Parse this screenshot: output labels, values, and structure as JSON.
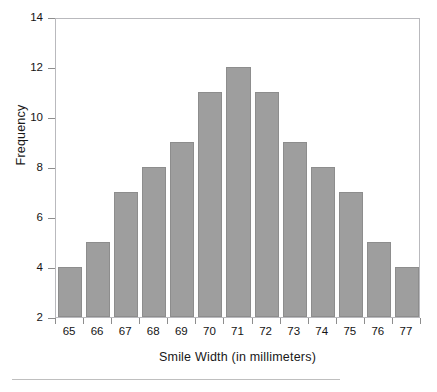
{
  "chart_data": {
    "type": "bar",
    "title": "",
    "subtitle": "",
    "xlabel": "Smile Width (in millimeters)",
    "ylabel": "Frequency",
    "categories": [
      "65",
      "66",
      "67",
      "68",
      "69",
      "70",
      "71",
      "72",
      "73",
      "74",
      "75",
      "76",
      "77"
    ],
    "values": [
      4,
      5,
      7,
      8,
      9,
      11,
      12,
      11,
      9,
      8,
      7,
      5,
      4
    ],
    "ylim": [
      2,
      14
    ],
    "ytick_labels": [
      "2",
      "4",
      "6",
      "8",
      "10",
      "12",
      "14"
    ],
    "ytick_values": [
      2,
      4,
      6,
      8,
      10,
      12,
      14
    ],
    "grid": false,
    "legend": false,
    "legend_position": "none",
    "bar_color": "#9e9e9e",
    "bar_edge_color": "#8d8d8d",
    "axis_color": "#b9b9bd",
    "background_color": "#ffffff"
  },
  "figure": {
    "bottom_rule_color": "#bfbfbf"
  }
}
